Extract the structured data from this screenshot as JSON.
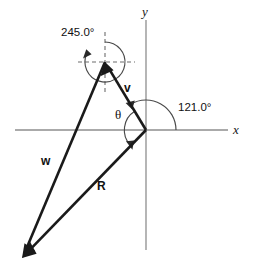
{
  "figure": {
    "background_color": "#ffffff",
    "axes": {
      "x_label": "x",
      "y_label": "y",
      "axis_color": "#8e8e8e",
      "origin": {
        "x": 146,
        "y": 130
      },
      "x_axis_start": {
        "x": 15,
        "y": 130
      },
      "x_axis_end": {
        "x": 228,
        "y": 130
      },
      "y_axis_start": {
        "x": 146,
        "y": 20
      },
      "y_axis_end": {
        "x": 146,
        "y": 250
      }
    },
    "vectors": [
      {
        "name": "v",
        "label": "v",
        "color": "#1a1a1a",
        "tail": {
          "x": 146,
          "y": 130
        },
        "tip": {
          "x": 105,
          "y": 62
        },
        "label_pos": {
          "x": 128,
          "y": 88
        }
      },
      {
        "name": "w",
        "label": "w",
        "color": "#1a1a1a",
        "tail": {
          "x": 105,
          "y": 62
        },
        "tip": {
          "x": 22,
          "y": 258
        },
        "label_pos": {
          "x": 45,
          "y": 161
        }
      },
      {
        "name": "R",
        "label": "R",
        "color": "#1a1a1a",
        "tail": {
          "x": 146,
          "y": 130
        },
        "tip": {
          "x": 22,
          "y": 258
        },
        "label_pos": {
          "x": 101,
          "y": 186
        }
      }
    ],
    "angles": [
      {
        "name": "bearing-245",
        "label": "245.0°",
        "value": 245.0,
        "unit": "degrees",
        "vertex": {
          "x": 105,
          "y": 62
        },
        "label_pos": {
          "x": 66,
          "y": 33
        },
        "radius": 20,
        "description": "bearing measured clockwise from north (up) at the tip of v to vector w"
      },
      {
        "name": "direction-121",
        "label": "121.0°",
        "value": 121.0,
        "unit": "degrees",
        "vertex": {
          "x": 146,
          "y": 130
        },
        "label_pos": {
          "x": 182,
          "y": 107
        },
        "radius": 30,
        "description": "angle measured counterclockwise from the positive x-axis to vector v"
      },
      {
        "name": "theta",
        "label": "θ",
        "value": null,
        "unit": "degrees",
        "vertex": {
          "x": 146,
          "y": 130
        },
        "label_pos": {
          "x": 120,
          "y": 115
        },
        "radius": 22,
        "description": "angle at the origin between vector v and vector R"
      }
    ],
    "reference_lines": [
      {
        "name": "horizontal-dashed-ref",
        "from": {
          "x": 78,
          "y": 62
        },
        "to": {
          "x": 135,
          "y": 62
        }
      },
      {
        "name": "vertical-dashed-ref",
        "from": {
          "x": 105,
          "y": 32
        },
        "to": {
          "x": 105,
          "y": 92
        }
      }
    ]
  }
}
